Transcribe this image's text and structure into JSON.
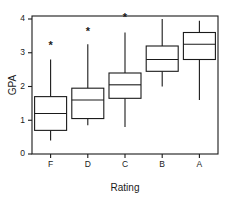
{
  "chart_data": {
    "type": "box",
    "title": "",
    "xlabel": "Rating",
    "ylabel": "GPA",
    "categories": [
      "F",
      "D",
      "C",
      "B",
      "A"
    ],
    "ylim": [
      0,
      4.2
    ],
    "yticks": [
      0,
      1,
      2,
      3,
      4
    ],
    "ytick_labels": [
      "0",
      "1",
      "2",
      "3",
      "4"
    ],
    "xtick_labels": [
      "F",
      "D",
      "C",
      "B",
      "A"
    ],
    "grid": false,
    "legend": null,
    "frame": "box",
    "boxes": [
      {
        "category": "F",
        "whisker_low": 0.4,
        "q1": 0.7,
        "median": 1.2,
        "q3": 1.7,
        "whisker_high": 2.8,
        "annotation": "*",
        "annotation_value": 3.2
      },
      {
        "category": "D",
        "whisker_low": 0.85,
        "q1": 1.05,
        "median": 1.6,
        "q3": 1.95,
        "whisker_high": 3.25,
        "annotation": "*",
        "annotation_value": 3.6
      },
      {
        "category": "C",
        "whisker_low": 0.8,
        "q1": 1.65,
        "median": 2.05,
        "q3": 2.4,
        "whisker_high": 3.6,
        "annotation": "*",
        "annotation_value": 4.02
      },
      {
        "category": "B",
        "whisker_low": 2.0,
        "q1": 2.45,
        "median": 2.8,
        "q3": 3.2,
        "whisker_high": 4.0,
        "annotation": null,
        "annotation_value": null
      },
      {
        "category": "A",
        "whisker_low": 1.6,
        "q1": 2.8,
        "median": 3.25,
        "q3": 3.6,
        "whisker_high": 3.95,
        "annotation": null,
        "annotation_value": null
      }
    ],
    "colors": {
      "line": "#1a1a1a",
      "box_fill": "#ffffff",
      "background": "#ffffff"
    }
  }
}
